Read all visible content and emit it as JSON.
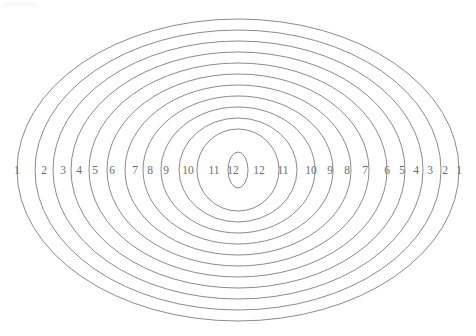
{
  "figure": {
    "title": "",
    "background_color": "#ffffff",
    "stroke_color": "#7e7e7e",
    "label_color": "#6e6e6e",
    "center_x": 238,
    "center_y": 170,
    "ring_count": 12
  },
  "chart_data": {
    "type": "scatter",
    "title": "",
    "subtitle": "",
    "xlabel": "",
    "ylabel": "",
    "grid": false,
    "legend": "none",
    "center": [
      238,
      170
    ],
    "ring_index": [
      1,
      2,
      3,
      4,
      5,
      6,
      7,
      8,
      9,
      10,
      11,
      12
    ],
    "semi_axis_x": [
      221,
      203,
      185,
      167,
      149,
      131,
      113,
      95,
      77,
      59,
      41,
      10
    ],
    "semi_axis_y": [
      151,
      140,
      129,
      118,
      107,
      96,
      85,
      74,
      63,
      52,
      41,
      18
    ],
    "left_labels": [
      {
        "text": "1",
        "x": 17,
        "y": 171
      },
      {
        "text": "2",
        "x": 44,
        "y": 171
      },
      {
        "text": "3",
        "x": 63,
        "y": 171
      },
      {
        "text": "4",
        "x": 79,
        "y": 171
      },
      {
        "text": "5",
        "x": 95,
        "y": 171
      },
      {
        "text": "6",
        "x": 112,
        "y": 171
      },
      {
        "text": "7",
        "x": 135,
        "y": 171
      },
      {
        "text": "8",
        "x": 150,
        "y": 171
      },
      {
        "text": "9",
        "x": 166,
        "y": 171
      },
      {
        "text": "10",
        "x": 188,
        "y": 171
      },
      {
        "text": "11",
        "x": 214,
        "y": 171
      },
      {
        "text": "12",
        "x": 233,
        "y": 171
      }
    ],
    "right_labels": [
      {
        "text": "12",
        "x": 259,
        "y": 171
      },
      {
        "text": "11",
        "x": 283,
        "y": 171
      },
      {
        "text": "10",
        "x": 311,
        "y": 171
      },
      {
        "text": "9",
        "x": 330,
        "y": 171
      },
      {
        "text": "8",
        "x": 347,
        "y": 171
      },
      {
        "text": "7",
        "x": 365,
        "y": 171
      },
      {
        "text": "6",
        "x": 387,
        "y": 171
      },
      {
        "text": "5",
        "x": 402,
        "y": 171
      },
      {
        "text": "4",
        "x": 416,
        "y": 171
      },
      {
        "text": "3",
        "x": 430,
        "y": 171
      },
      {
        "text": "2",
        "x": 445,
        "y": 171
      },
      {
        "text": "1",
        "x": 459,
        "y": 171
      }
    ]
  }
}
